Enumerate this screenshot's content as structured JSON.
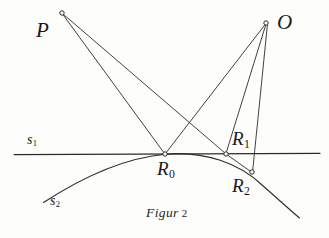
{
  "figure": {
    "caption_text": "Figur",
    "caption_number": "2",
    "background_color": "#fdfdfb",
    "ink_color": "#2b2b2b",
    "points": [
      {
        "id": "P",
        "label": "P",
        "sub": "",
        "x": 62,
        "y": 13,
        "label_x": 36,
        "label_y": 20
      },
      {
        "id": "O",
        "label": "O",
        "sub": "",
        "x": 266,
        "y": 23,
        "label_x": 277,
        "label_y": 12
      },
      {
        "id": "R0",
        "label": "R",
        "sub": "0",
        "x": 165,
        "y": 154,
        "label_x": 157,
        "label_y": 159
      },
      {
        "id": "R1",
        "label": "R",
        "sub": "1",
        "x": 226,
        "y": 154,
        "label_x": 232,
        "label_y": 129
      },
      {
        "id": "R2",
        "label": "R",
        "sub": "2",
        "x": 252,
        "y": 173,
        "label_x": 232,
        "label_y": 176
      }
    ],
    "curves": [
      {
        "id": "s1",
        "label": "s",
        "sub": "1",
        "type": "straight-line",
        "label_x": 27,
        "label_y": 133
      },
      {
        "id": "s2",
        "label": "s",
        "sub": "2",
        "type": "arc",
        "label_x": 50,
        "label_y": 194
      }
    ],
    "segments": [
      {
        "from": "P",
        "to": "R0"
      },
      {
        "from": "P",
        "to": "R1"
      },
      {
        "from": "O",
        "to": "R0"
      },
      {
        "from": "O",
        "to": "R1"
      },
      {
        "from": "O",
        "to": "R2"
      },
      {
        "from": "R1",
        "to": "R2"
      }
    ]
  }
}
